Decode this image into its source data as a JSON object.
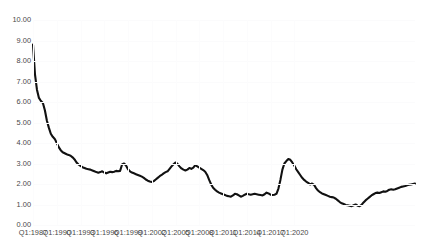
{
  "chart_data": {
    "type": "line",
    "title": "",
    "xlabel": "",
    "ylabel": "",
    "ylim": [
      0,
      10
    ],
    "ytick_labels": [
      "10.00",
      "9.00",
      "8.00",
      "7.00",
      "6.00",
      "5.00",
      "4.00",
      "3.00",
      "2.00",
      "1.00",
      "0.00"
    ],
    "ytick_values": [
      10,
      9,
      8,
      7,
      6,
      5,
      4,
      3,
      2,
      1,
      0
    ],
    "xtick_labels": [
      "Q1:1987",
      "Q1:1990",
      "Q1:1993",
      "Q1:1996",
      "Q1:1999",
      "Q1:2002",
      "Q1:2005",
      "Q1:2008",
      "Q1:2011",
      "Q1:2014",
      "Q1:2017",
      "Q1:2020"
    ],
    "grid": true,
    "legend": "none",
    "line_color": "#111111",
    "x_start": "Q1:1987",
    "x_end": "Q4:2020",
    "x_frequency": "quarterly",
    "series": [
      {
        "name": "rate",
        "values": [
          8.8,
          7.35,
          6.6,
          6.2,
          6.05,
          5.95,
          5.6,
          5.1,
          4.75,
          4.45,
          4.3,
          4.2,
          4.0,
          3.8,
          3.65,
          3.55,
          3.5,
          3.45,
          3.42,
          3.38,
          3.3,
          3.2,
          3.05,
          2.95,
          2.88,
          2.82,
          2.78,
          2.74,
          2.72,
          2.7,
          2.66,
          2.62,
          2.58,
          2.55,
          2.58,
          2.62,
          2.56,
          2.52,
          2.56,
          2.6,
          2.58,
          2.6,
          2.64,
          2.62,
          2.64,
          2.95,
          3.0,
          2.9,
          2.72,
          2.62,
          2.56,
          2.52,
          2.48,
          2.44,
          2.4,
          2.36,
          2.3,
          2.22,
          2.16,
          2.12,
          2.1,
          2.14,
          2.22,
          2.3,
          2.38,
          2.44,
          2.52,
          2.58,
          2.62,
          2.74,
          2.86,
          2.96,
          3.05,
          2.98,
          2.86,
          2.76,
          2.7,
          2.66,
          2.7,
          2.78,
          2.74,
          2.8,
          2.92,
          2.86,
          2.8,
          2.74,
          2.68,
          2.6,
          2.44,
          2.2,
          1.98,
          1.82,
          1.72,
          1.64,
          1.58,
          1.54,
          1.5,
          1.46,
          1.42,
          1.4,
          1.38,
          1.44,
          1.52,
          1.5,
          1.44,
          1.38,
          1.42,
          1.48,
          1.52,
          1.5,
          1.48,
          1.5,
          1.52,
          1.5,
          1.48,
          1.46,
          1.44,
          1.5,
          1.58,
          1.54,
          1.48,
          1.46,
          1.48,
          1.52,
          1.78,
          2.2,
          2.7,
          3.0,
          3.12,
          3.22,
          3.18,
          3.05,
          2.9,
          2.72,
          2.58,
          2.44,
          2.3,
          2.2,
          2.12,
          2.06,
          1.98,
          2.02,
          1.96,
          1.8,
          1.68,
          1.6,
          1.54,
          1.5,
          1.46,
          1.42,
          1.38,
          1.36,
          1.34,
          1.28,
          1.2,
          1.12,
          1.06,
          1.02,
          0.98,
          0.96,
          0.94,
          0.92,
          0.96,
          1.0,
          0.94,
          0.92,
          0.98,
          1.1,
          1.2,
          1.28,
          1.36,
          1.44,
          1.5,
          1.56,
          1.58,
          1.56,
          1.6,
          1.64,
          1.62,
          1.66,
          1.72,
          1.74,
          1.72,
          1.74,
          1.78,
          1.82,
          1.86,
          1.88,
          1.9,
          1.94,
          1.96,
          1.98,
          2.0,
          2.02
        ]
      }
    ]
  }
}
